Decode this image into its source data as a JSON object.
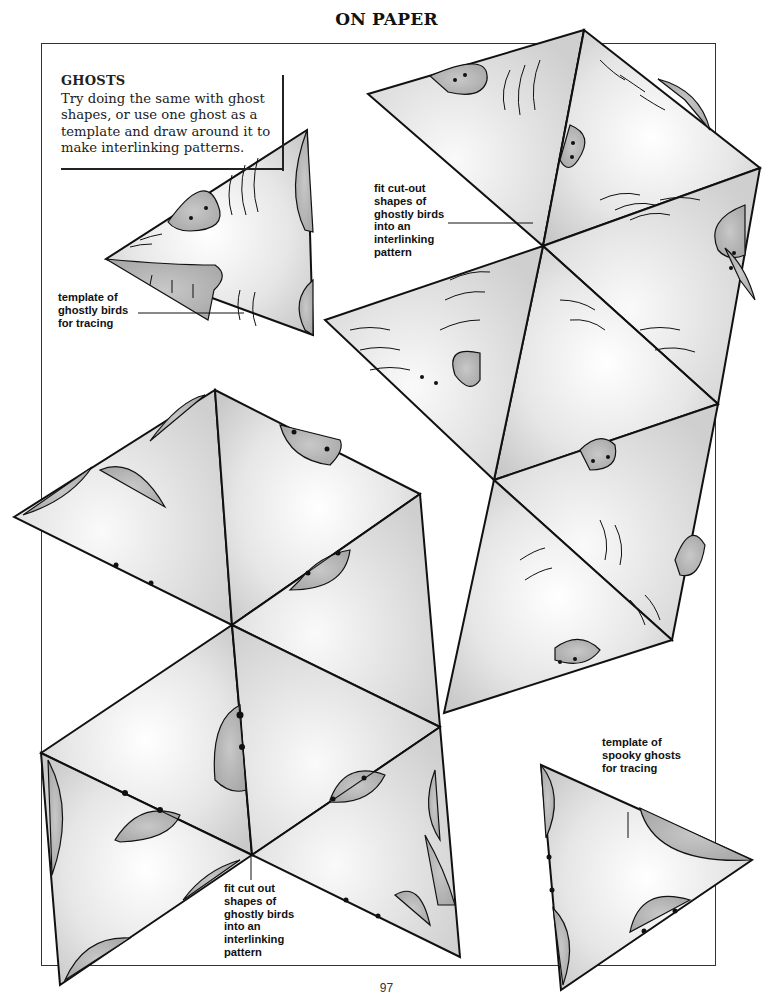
{
  "header": {
    "title": "ON PAPER"
  },
  "intro": {
    "heading": "GHOSTS",
    "body": "Try doing the same with ghost shapes, or use one ghost as a template and draw around it to make interlinking patterns."
  },
  "captions": {
    "template_birds": [
      "template of",
      "ghostly birds",
      "for tracing"
    ],
    "fit_top": [
      "fit cut-out",
      "shapes of",
      "ghostly birds",
      "into an",
      "interlinking",
      "pattern"
    ],
    "fit_bottom": [
      "fit cut out",
      "shapes of",
      "ghostly birds",
      "into an",
      "interlinking",
      "pattern"
    ],
    "template_ghosts": [
      "template of",
      "spooky ghosts",
      "for tracing"
    ]
  },
  "footer": {
    "page_number": "97"
  },
  "colors": {
    "paper": "#ffffff",
    "ink": "#111111",
    "shape_light": "#f4f4f4",
    "shape_mid": "#d6d6d6",
    "ghost_fill": "#b8b8b8"
  }
}
